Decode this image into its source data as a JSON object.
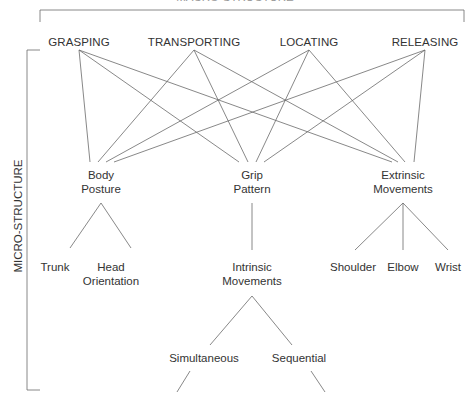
{
  "diagram": {
    "top_title": "MACRO-STRUCTURE",
    "side_title": "MICRO-STRUCTURE",
    "macro_phases": [
      {
        "label": "GRASPING",
        "x": 79
      },
      {
        "label": "TRANSPORTING",
        "x": 194
      },
      {
        "label": "LOCATING",
        "x": 309
      },
      {
        "label": "RELEASING",
        "x": 425
      }
    ],
    "micro_components": {
      "body_posture": {
        "line1": "Body",
        "line2": "Posture"
      },
      "grip_pattern": {
        "line1": "Grip",
        "line2": "Pattern"
      },
      "extrinsic_movements": {
        "line1": "Extrinsic",
        "line2": "Movements"
      }
    },
    "body_posture_children": {
      "trunk": "Trunk",
      "head_orientation": {
        "line1": "Head",
        "line2": "Orientation"
      }
    },
    "grip_pattern_children": {
      "intrinsic_movements": {
        "line1": "Intrinsic",
        "line2": "Movements"
      }
    },
    "extrinsic_children": {
      "shoulder": "Shoulder",
      "elbow": "Elbow",
      "wrist": "Wrist"
    },
    "intrinsic_children": {
      "simultaneous": "Simultaneous",
      "sequential": "Sequential"
    },
    "line_color": "#555555"
  }
}
